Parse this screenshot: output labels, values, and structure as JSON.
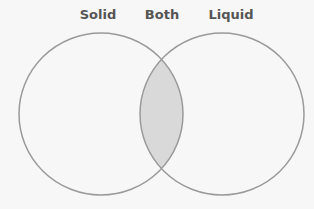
{
  "diagram": {
    "type": "venn",
    "labels": {
      "left": "Solid",
      "intersection": "Both",
      "right": "Liquid"
    },
    "colors": {
      "outline": "#9a9a9a",
      "intersection_fill": "#d9d9d9",
      "background": "#f7f7f7",
      "label": "#555555"
    }
  }
}
